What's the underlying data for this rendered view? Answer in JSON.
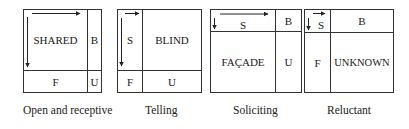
{
  "panels": [
    {
      "name": "open-and-receptive",
      "caption": "Open and receptive",
      "cells": {
        "shared": "SHARED",
        "blind": "B",
        "facade": "F",
        "unknown": "U"
      }
    },
    {
      "name": "telling",
      "caption": "Telling",
      "cells": {
        "shared": "S",
        "blind": "BLIND",
        "facade": "F",
        "unknown": "U"
      }
    },
    {
      "name": "soliciting",
      "caption": "Soliciting",
      "cells": {
        "shared": "S",
        "blind": "B",
        "facade": "FAÇADE",
        "unknown": "U"
      }
    },
    {
      "name": "reluctant",
      "caption": "Reluctant",
      "cells": {
        "shared": "S",
        "blind": "B",
        "facade": "F",
        "unknown": "UNKNOWN"
      }
    }
  ],
  "colors": {
    "line": "#333333",
    "text": "#1a1a1a",
    "background": "#ffffff"
  }
}
